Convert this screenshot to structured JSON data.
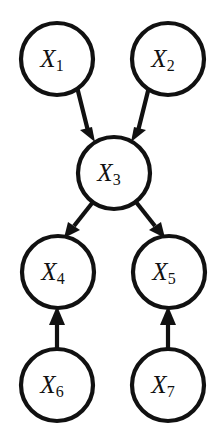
{
  "figure": {
    "kind": "directed-acyclic-graph",
    "title": "",
    "background_color": "#ffffff",
    "stroke_color": "#111111",
    "label_color": "#111111",
    "node_fill": "#ffffff",
    "node_radius": 36,
    "stroke_width": 4.2
  },
  "chart_data": {
    "type": "diagram",
    "title": "",
    "xlabel": "",
    "ylabel": "",
    "nodes": [
      {
        "id": "X1",
        "base": "X",
        "sub": "1",
        "label": "X₁",
        "cx": 57,
        "cy": 59,
        "r": 36,
        "layer": 0
      },
      {
        "id": "X2",
        "base": "X",
        "sub": "2",
        "label": "X₂",
        "cx": 168,
        "cy": 59,
        "r": 36,
        "layer": 0
      },
      {
        "id": "X3",
        "base": "X",
        "sub": "3",
        "label": "X₃",
        "cx": 114,
        "cy": 173,
        "r": 36,
        "layer": 1
      },
      {
        "id": "X4",
        "base": "X",
        "sub": "4",
        "label": "X₄",
        "cx": 58,
        "cy": 272,
        "r": 36,
        "layer": 2
      },
      {
        "id": "X5",
        "base": "X",
        "sub": "5",
        "label": "X₅",
        "cx": 169,
        "cy": 272,
        "r": 36,
        "layer": 2
      },
      {
        "id": "X6",
        "base": "X",
        "sub": "6",
        "label": "X₆",
        "cx": 57,
        "cy": 385,
        "r": 36,
        "layer": 3
      },
      {
        "id": "X7",
        "base": "X",
        "sub": "7",
        "label": "X₇",
        "cx": 168,
        "cy": 385,
        "r": 36,
        "layer": 3
      }
    ],
    "edges": [
      {
        "id": "e1",
        "from": "X1",
        "to": "X3",
        "directed": true,
        "arrow_direction": "down-right"
      },
      {
        "id": "e2",
        "from": "X2",
        "to": "X3",
        "directed": true,
        "arrow_direction": "down-left"
      },
      {
        "id": "e3",
        "from": "X3",
        "to": "X4",
        "directed": true,
        "arrow_direction": "down-left"
      },
      {
        "id": "e4",
        "from": "X3",
        "to": "X5",
        "directed": true,
        "arrow_direction": "down-right"
      },
      {
        "id": "e5",
        "from": "X6",
        "to": "X4",
        "directed": true,
        "arrow_direction": "up"
      },
      {
        "id": "e6",
        "from": "X7",
        "to": "X5",
        "directed": true,
        "arrow_direction": "up"
      }
    ],
    "legend": [],
    "annotations": []
  }
}
